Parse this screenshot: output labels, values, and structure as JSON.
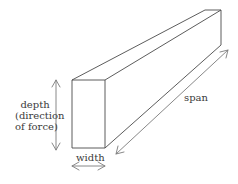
{
  "diagram": {
    "colors": {
      "line": "#4a4a4a",
      "arrow": "#7a7a7a",
      "text": "#3a3a3a",
      "background": "#ffffff"
    },
    "beam": {
      "front_face": {
        "x1": 72,
        "y1": 80,
        "x2": 105,
        "y2": 148
      },
      "back_top_left": [
        205,
        10
      ],
      "back_top_right": [
        221,
        10
      ],
      "back_bottom_right": [
        221,
        45
      ]
    },
    "labels": {
      "depth_line1": "depth",
      "depth_line2": "(direction",
      "depth_line3": "of force)",
      "width": "width",
      "span": "span"
    },
    "arrows": [
      {
        "name": "depth-arrow",
        "from": [
          56,
          80
        ],
        "to": [
          56,
          150
        ],
        "double": true
      },
      {
        "name": "width-arrow",
        "from": [
          72,
          166
        ],
        "to": [
          105,
          166
        ],
        "double": true
      },
      {
        "name": "span-arrow",
        "from": [
          116,
          154
        ],
        "to": [
          228,
          50
        ],
        "double": true
      }
    ]
  }
}
